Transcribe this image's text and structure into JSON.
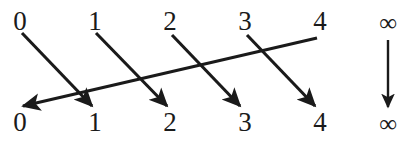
{
  "figure": {
    "kind": "mapping-diagram",
    "ink_color": "#1a1a1a",
    "background_color": "#ffffff",
    "top_row": [
      {
        "label": "0",
        "x": 20
      },
      {
        "label": "1",
        "x": 95
      },
      {
        "label": "2",
        "x": 170
      },
      {
        "label": "3",
        "x": 245
      },
      {
        "label": "4",
        "x": 320
      },
      {
        "label": "∞",
        "x": 388
      }
    ],
    "bottom_row": [
      {
        "label": "0",
        "x": 20
      },
      {
        "label": "1",
        "x": 95
      },
      {
        "label": "2",
        "x": 170
      },
      {
        "label": "3",
        "x": 245
      },
      {
        "label": "4",
        "x": 320
      },
      {
        "label": "∞",
        "x": 388
      }
    ],
    "arrows": [
      {
        "name": "arrow-0-to-1",
        "from": "0",
        "to": "1",
        "x1": 22,
        "y1": 33,
        "x2": 92,
        "y2": 106
      },
      {
        "name": "arrow-1-to-2",
        "from": "1",
        "to": "2",
        "x1": 96,
        "y1": 33,
        "x2": 167,
        "y2": 106
      },
      {
        "name": "arrow-2-to-3",
        "from": "2",
        "to": "3",
        "x1": 172,
        "y1": 35,
        "x2": 240,
        "y2": 106
      },
      {
        "name": "arrow-3-to-4",
        "from": "3",
        "to": "4",
        "x1": 247,
        "y1": 35,
        "x2": 315,
        "y2": 106
      },
      {
        "name": "arrow-4-to-0",
        "from": "4",
        "to": "0",
        "x1": 317,
        "y1": 38,
        "x2": 23,
        "y2": 106
      },
      {
        "name": "arrow-inf-to-inf",
        "from": "∞",
        "to": "∞",
        "x1": 388,
        "y1": 40,
        "x2": 388,
        "y2": 107
      }
    ]
  }
}
